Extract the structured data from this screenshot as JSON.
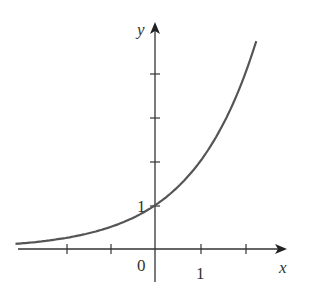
{
  "chart_data": {
    "type": "line",
    "title": "",
    "function": "y = 2^x",
    "xlabel": "x",
    "ylabel": "y",
    "xlim": [
      -3.1,
      2.9
    ],
    "ylim": [
      -0.7,
      5.1
    ],
    "x_ticks": [
      -2,
      -1,
      1,
      2
    ],
    "y_ticks": [
      1,
      2,
      3,
      4
    ],
    "tick_labels": {
      "origin": "0",
      "x_one": "1",
      "y_one": "1"
    },
    "series": [
      {
        "name": "exponential curve",
        "x": [
          -3.1,
          -3,
          -2.5,
          -2,
          -1.5,
          -1,
          -0.5,
          0,
          0.5,
          1,
          1.5,
          2,
          2.25
        ],
        "y": [
          0.117,
          0.125,
          0.177,
          0.25,
          0.354,
          0.5,
          0.707,
          1,
          1.414,
          2,
          2.828,
          4,
          4.757
        ]
      }
    ],
    "grid": false,
    "legend": "none",
    "colors": {
      "curve": "#555555",
      "axes": "#333333"
    }
  }
}
